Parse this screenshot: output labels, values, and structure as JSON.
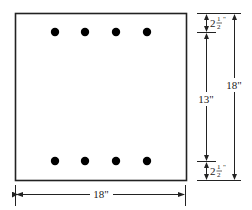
{
  "diagram": {
    "type": "beam-cross-section",
    "section": {
      "width_label": "18\"",
      "height_label": "18\""
    },
    "reinforcement": {
      "top_bars": 4,
      "bottom_bars": 4
    },
    "dimensions": {
      "width": {
        "label": "18\""
      },
      "total_height": {
        "label": "18\""
      },
      "bar_spacing": {
        "label": "13\""
      },
      "top_cover": {
        "whole": "2",
        "num": "1",
        "den": "2",
        "unit": "\""
      },
      "bottom_cover": {
        "whole": "2",
        "num": "1",
        "den": "2",
        "unit": "\""
      }
    },
    "colors": {
      "line": "#222222",
      "bar": "#000000",
      "background": "#ffffff"
    }
  }
}
